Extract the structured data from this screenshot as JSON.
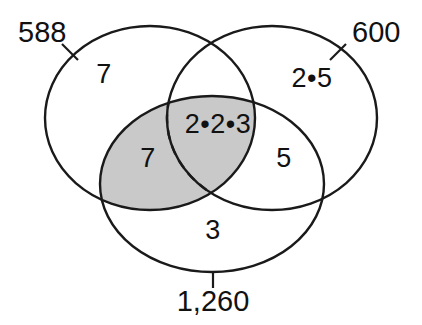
{
  "figure": {
    "kind": "venn-diagram",
    "set_count": 3,
    "background_color": "#ffffff",
    "stroke_color": "#1a1a1a",
    "shade_color": "#c9c9c9"
  },
  "sets": [
    {
      "id": "left",
      "label": "588",
      "label_x": 18,
      "label_y": 34,
      "tick": {
        "x1": 62,
        "y1": 44,
        "x2": 78,
        "y2": 60
      }
    },
    {
      "id": "right",
      "label": "600",
      "label_x": 352,
      "label_y": 34,
      "tick": {
        "x1": 346,
        "y1": 44,
        "x2": 330,
        "y2": 60
      }
    },
    {
      "id": "bottom",
      "label": "1,260",
      "label_x": 213,
      "label_y": 303,
      "tick": {
        "x1": 213,
        "y1": 272,
        "x2": 213,
        "y2": 288
      }
    }
  ],
  "regions": [
    {
      "id": "left-only",
      "value": "7",
      "x": 104,
      "y": 76,
      "shaded": false
    },
    {
      "id": "right-only",
      "value": "2•5",
      "x": 312,
      "y": 80,
      "shaded": false
    },
    {
      "id": "triple-center",
      "value": "2•2•3",
      "x": 218,
      "y": 126,
      "shaded": true
    },
    {
      "id": "left-bottom",
      "value": "7",
      "x": 148,
      "y": 160,
      "shaded": true
    },
    {
      "id": "right-bottom",
      "value": "5",
      "x": 284,
      "y": 160,
      "shaded": false
    },
    {
      "id": "bottom-only",
      "value": "3",
      "x": 213,
      "y": 232,
      "shaded": false
    }
  ],
  "geometry": {
    "left_ellipse": {
      "cx": 150,
      "cy": 118,
      "rx": 105,
      "ry": 92
    },
    "right_ellipse": {
      "cx": 272,
      "cy": 118,
      "rx": 105,
      "ry": 92
    },
    "bottom_ellipse": {
      "cx": 212,
      "cy": 184,
      "rx": 112,
      "ry": 88
    }
  }
}
